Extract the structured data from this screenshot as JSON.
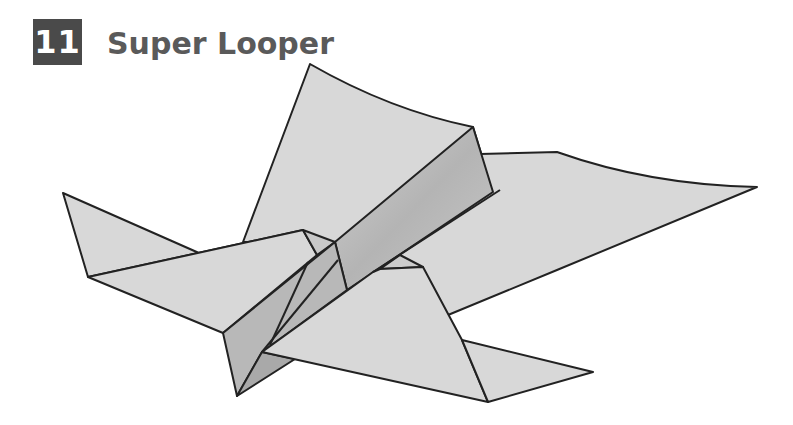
{
  "step": {
    "number": "11",
    "title": "Super Looper"
  },
  "illustration": {
    "subject": "paper-airplane-diagram",
    "colors": {
      "paper": "#d6d6d6",
      "paper_shade": "#bdbdbd",
      "paper_dark": "#a9a9a9",
      "outline": "#222222"
    }
  }
}
